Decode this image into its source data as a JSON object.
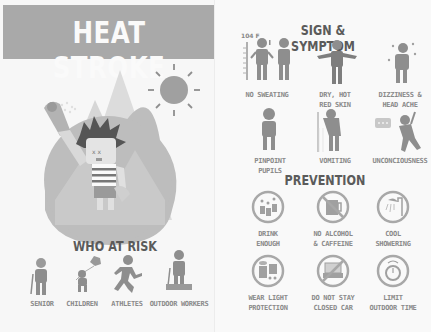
{
  "poster": {
    "title": "HEAT STROKE",
    "colors": {
      "banner": "#a9a9a9",
      "banner_text": "#fafafa",
      "heading": "#5b5b5b",
      "icon": "#8c8c8c",
      "label": "#8a8a8a",
      "background": "#f7f7f7"
    }
  },
  "risk": {
    "title": "WHO AT RISK",
    "groups": [
      {
        "label": "SENIOR",
        "icon": "senior-icon"
      },
      {
        "label": "CHILDREN",
        "icon": "child-balloon-icon"
      },
      {
        "label": "ATHLETES",
        "icon": "runner-icon"
      },
      {
        "label": "OUTDOOR WORKERS",
        "icon": "worker-cart-icon"
      }
    ]
  },
  "symptoms": {
    "title": "SIGN & SYMPTOM",
    "thermometer_label": "104 F",
    "items": [
      {
        "line1": "NO SWEATING",
        "line2": "",
        "icon": "no-sweat-icon"
      },
      {
        "line1": "DRY, HOT",
        "line2": "RED SKIN",
        "icon": "hot-skin-icon"
      },
      {
        "line1": "DIZZINESS &",
        "line2": "HEAD ACHE",
        "icon": "dizzy-icon"
      },
      {
        "line1": "PINPOINT",
        "line2": "PUPILS",
        "icon": "pupils-icon"
      },
      {
        "line1": "VOMITING",
        "line2": "",
        "icon": "vomit-icon"
      },
      {
        "line1": "UNCONCIOUSNESS",
        "line2": "",
        "icon": "faint-icon"
      }
    ]
  },
  "prevention": {
    "title": "PREVENTION",
    "items": [
      {
        "line1": "DRINK",
        "line2": "ENOUGH",
        "icon": "water-bottles-icon"
      },
      {
        "line1": "NO ALCOHOL",
        "line2": "& CAFFEINE",
        "icon": "no-beer-icon"
      },
      {
        "line1": "COOL",
        "line2": "SHOWERING",
        "icon": "shower-icon"
      },
      {
        "line1": "WEAR LIGHT",
        "line2": "PROTECTION",
        "icon": "light-clothes-icon"
      },
      {
        "line1": "DO NOT STAY",
        "line2": "CLOSED CAR",
        "icon": "no-car-icon"
      },
      {
        "line1": "LIMIT",
        "line2": "OUTDOOR TIME",
        "icon": "timer-icon"
      }
    ]
  }
}
